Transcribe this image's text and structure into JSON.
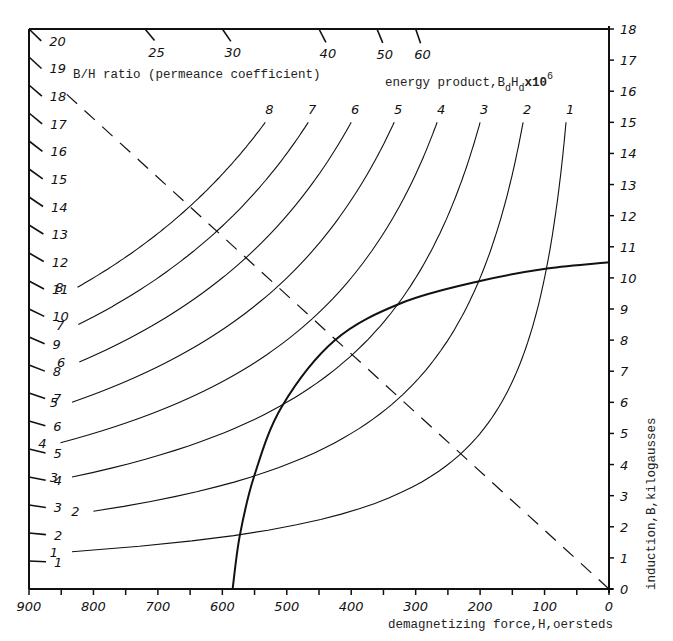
{
  "chart_data": {
    "type": "line",
    "title": "",
    "xlabel": "demagnetizing force,H,oersteds",
    "ylabel": "induction,B,kilogausses",
    "xlim": [
      900,
      0
    ],
    "ylim": [
      0,
      18
    ],
    "x_ticks": [
      900,
      800,
      700,
      600,
      500,
      400,
      300,
      200,
      100,
      0
    ],
    "y_ticks": [
      0,
      1,
      2,
      3,
      4,
      5,
      6,
      7,
      8,
      9,
      10,
      11,
      12,
      13,
      14,
      15,
      16,
      17,
      18
    ],
    "grid": false,
    "series": [
      {
        "name": "demagnetization curve",
        "style": "solid-bold",
        "x": [
          584,
          573,
          551,
          508,
          425,
          321,
          200,
          96,
          0
        ],
        "y": [
          0,
          1.7,
          3.6,
          5.85,
          8.0,
          9.2,
          9.9,
          10.3,
          10.5
        ]
      },
      {
        "name": "load line (B/H ratio)",
        "style": "dashed",
        "x": [
          0,
          852
        ],
        "y": [
          0,
          16.1
        ]
      }
    ],
    "energy_product_curves": {
      "label": "energy product, BdHd x10^6",
      "values": [
        1,
        2,
        3,
        4,
        5,
        6,
        7,
        8
      ],
      "note": "hyperbolas B(kG) * H(Oe) = value * 1000"
    },
    "permeance_scale": {
      "label": "B/H ratio (permeance coefficient)",
      "left_ticks": [
        1,
        2,
        3,
        4,
        5,
        6,
        7,
        8,
        9,
        10,
        11,
        12,
        13,
        14,
        15,
        16,
        17,
        18,
        19,
        20
      ],
      "top_ticks": [
        25,
        30,
        40,
        50,
        60
      ]
    }
  },
  "labels": {
    "permeance": "B/H ratio (permeance coefficient)",
    "energy_prefix": "energy product,B",
    "energy_sub1": "d",
    "energy_mid": "H",
    "energy_sub2": "d",
    "energy_suffix": "x10",
    "energy_sup": "6",
    "xlabel": "demagnetizing force,H,oersteds",
    "ylabel": "induction,B,kilogausses"
  }
}
